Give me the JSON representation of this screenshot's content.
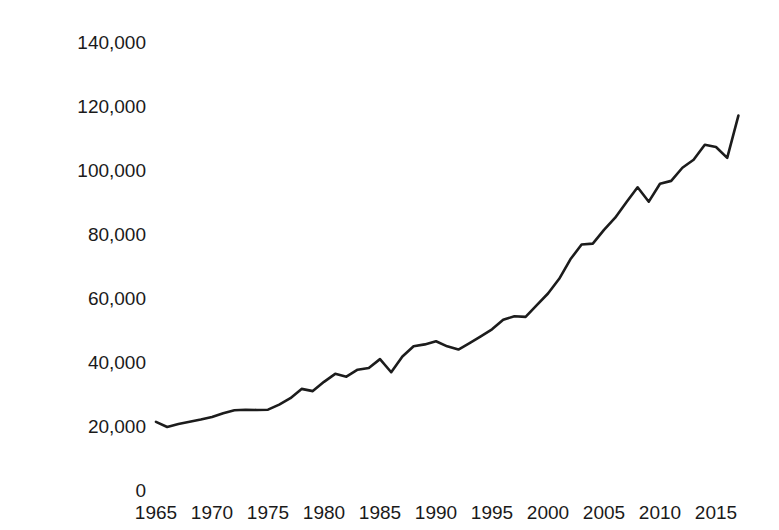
{
  "chart_data": {
    "type": "line",
    "title": "",
    "subtitle": "",
    "xlabel": "",
    "ylabel": "US$ millions",
    "xlim": [
      1964.2,
      1964.2
    ],
    "ylim": [
      0,
      140000
    ],
    "grid": false,
    "legend": null,
    "legend_position": "none",
    "y_ticks": [
      0,
      20000,
      40000,
      60000,
      80000,
      100000,
      120000,
      140000
    ],
    "y_tick_labels": [
      "0",
      "20,000",
      "40,000",
      "60,000",
      "80,000",
      "100,000",
      "120,000",
      "140,000"
    ],
    "x_ticks": [
      1965,
      1970,
      1975,
      1980,
      1985,
      1990,
      1995,
      2000,
      2005,
      2010,
      2015
    ],
    "x_tick_labels": [
      "1965",
      "1970",
      "1975",
      "1980",
      "1985",
      "1990",
      "1995",
      "2000",
      "2005",
      "2010",
      "2015"
    ],
    "series": [
      {
        "name": "value",
        "color": "#1c1c1c",
        "x": [
          1965,
          1966,
          1967,
          1968,
          1969,
          1970,
          1971,
          1972,
          1973,
          1974,
          1975,
          1976,
          1977,
          1978,
          1979,
          1980,
          1981,
          1982,
          1983,
          1984,
          1985,
          1986,
          1987,
          1988,
          1989,
          1990,
          1991,
          1992,
          1993,
          1994,
          1995,
          1996,
          1997,
          1998,
          1999,
          2000,
          2001,
          2002,
          2003,
          2004,
          2005,
          2006,
          2007,
          2008,
          2009,
          2010,
          2011,
          2012,
          2013,
          2014,
          2015,
          2016,
          2017
        ],
        "values": [
          21300,
          19700,
          20600,
          21300,
          22000,
          22800,
          24000,
          24900,
          25100,
          25000,
          25100,
          26700,
          28700,
          31600,
          30900,
          33800,
          36300,
          35400,
          37600,
          38100,
          40900,
          36800,
          41700,
          44900,
          45500,
          46500,
          44900,
          43900,
          45900,
          48000,
          50200,
          53200,
          54300,
          54100,
          57800,
          61400,
          66000,
          72100,
          76700,
          77000,
          81300,
          85100,
          89900,
          94600,
          90100,
          95700,
          96600,
          100700,
          103200,
          107900,
          107200,
          103800,
          117000
        ]
      }
    ]
  },
  "axis": {
    "y_title": "US$ millions"
  }
}
